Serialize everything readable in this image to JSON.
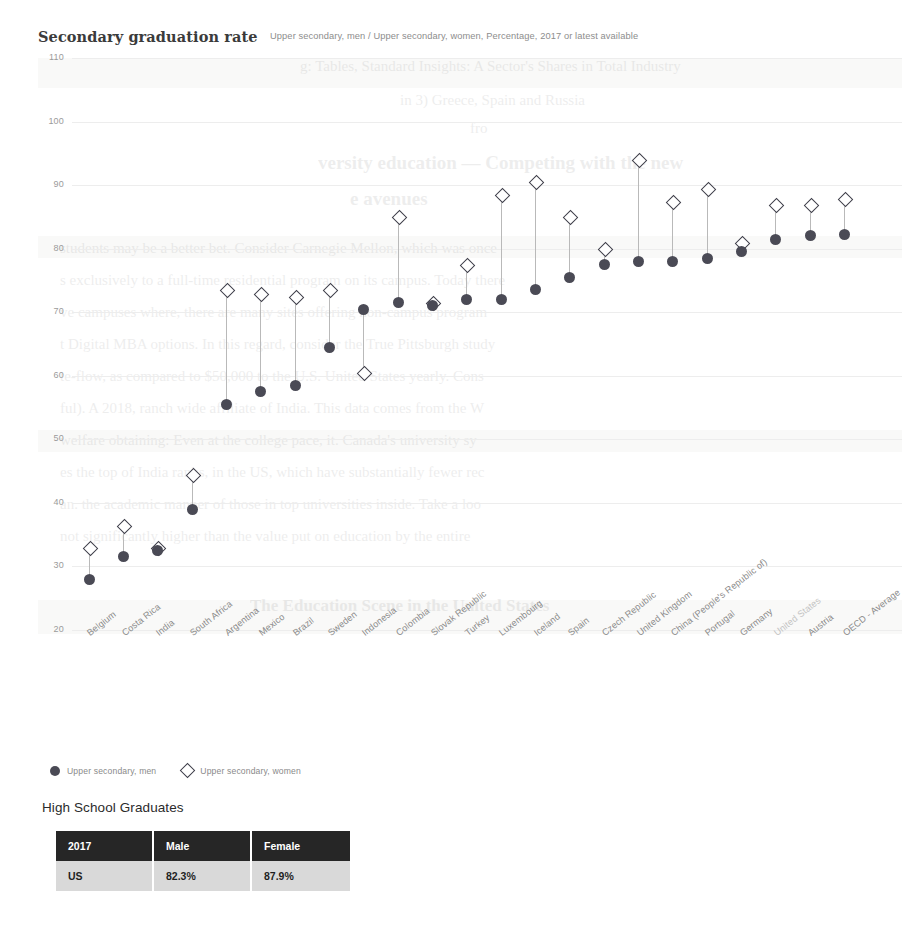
{
  "chart_header": {
    "title": "Secondary graduation rate",
    "subtitle": "Upper secondary, men / Upper secondary, women, Percentage, 2017 or latest available"
  },
  "legend": {
    "men": {
      "label": "Upper secondary, men",
      "icon": "filled-circle-icon",
      "color": "#4a4a55"
    },
    "women": {
      "label": "Upper secondary, women",
      "icon": "open-diamond-icon",
      "color": "#3f3f4a"
    }
  },
  "chart_data": {
    "type": "scatter",
    "title": "Secondary graduation rate",
    "subtitle": "Upper secondary, men / Upper secondary, women, Percentage, 2017 or latest available",
    "xlabel": "",
    "ylabel": "Percentage",
    "ylim": [
      20,
      110
    ],
    "yticks": [
      110,
      100,
      90,
      80,
      70,
      60,
      50,
      40,
      30,
      20
    ],
    "grid": true,
    "legend_position": "bottom-left",
    "categories": [
      "Belgium",
      "Costa Rica",
      "India",
      "South Africa",
      "Argentina",
      "Mexico",
      "Brazil",
      "Sweden",
      "Indonesia",
      "Colombia",
      "Slovak Republic",
      "Turkey",
      "Luxembourg",
      "Iceland",
      "Spain",
      "Czech Republic",
      "United Kingdom",
      "China (People's Republic of)",
      "Portugal",
      "Germany",
      "United States",
      "Austria",
      "OECD - Average",
      ""
    ],
    "series": [
      {
        "name": "Upper secondary, men",
        "marker": "filled-circle",
        "color": "#4a4a55",
        "values": [
          28.0,
          31.5,
          32.5,
          39.0,
          55.5,
          57.5,
          58.5,
          64.5,
          70.5,
          71.5,
          71.0,
          72.0,
          72.0,
          73.5,
          75.5,
          77.5,
          78.0,
          78.0,
          78.5,
          79.5,
          81.5,
          82.0,
          82.3,
          null
        ]
      },
      {
        "name": "Upper secondary, women",
        "marker": "open-diamond",
        "color": "#3f3f4a",
        "values": [
          33.0,
          36.5,
          33.0,
          44.5,
          73.5,
          73.0,
          72.5,
          73.5,
          60.5,
          85.0,
          71.5,
          77.5,
          88.5,
          90.5,
          85.0,
          80.0,
          94.0,
          87.5,
          89.5,
          81.0,
          87.0,
          87.0,
          87.9,
          null
        ]
      }
    ]
  },
  "xaxis_faint_labels": [
    "United States"
  ],
  "table_block": {
    "caption": "High School Graduates",
    "columns": [
      "2017",
      "Male",
      "Female"
    ],
    "rows": [
      [
        "US",
        "82.3%",
        "87.9%"
      ]
    ]
  },
  "ghost_text": {
    "lines": [
      "g: Tables, Standard Insights: A Sector's Shares in Total Industry",
      "in 3) Greece, Spain and Russia",
      "versity education — Competing with the new",
      "e avenues",
      "fro",
      "students may be a better bet. Consider Carnegie Mellon, which was once",
      "s exclusively to a full-time residential program on its campus. Today there",
      "ve campuses where, there are many sites offering non-campus program",
      "t Digital MBA options. In this regard, consider the True Pittsburgh study",
      "te-flow, as compared to $50,000 to the U.S. United States yearly. Cons",
      "ful). A 2018, ranch wide affiliate of India. This data comes from the W",
      "welfare obtaining: Even at the college pace, it. Canada's university sy",
      "es the top of India ranks, in the US, which have substantially fewer rec",
      "an. the academic manner of those in top universities inside. Take a loo",
      "not significantly higher than the value put on education by the entire",
      "The Education Scene in the United States"
    ]
  }
}
